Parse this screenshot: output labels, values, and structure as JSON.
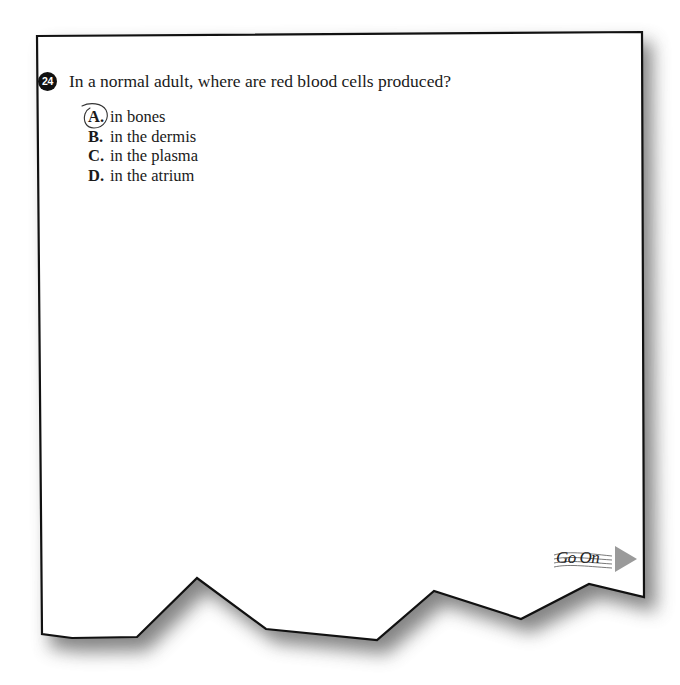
{
  "question": {
    "number": "24",
    "stem": "In a normal adult, where are red blood cells produced?",
    "choices": [
      {
        "letter": "A.",
        "text": "in bones",
        "marked": true
      },
      {
        "letter": "B.",
        "text": "in the dermis",
        "marked": false
      },
      {
        "letter": "C.",
        "text": "in the plasma",
        "marked": false
      },
      {
        "letter": "D.",
        "text": "in the atrium",
        "marked": false
      }
    ],
    "selected_answer": "A."
  },
  "navigation": {
    "go_on_label": "Go On",
    "go_on_icon": "arrow-right-triangle-icon"
  },
  "colors": {
    "page_background": "#ffffff",
    "border": "#111111",
    "shadow": "#7a7a7a",
    "badge": "#111111",
    "arrow": "#9a9a9a"
  }
}
